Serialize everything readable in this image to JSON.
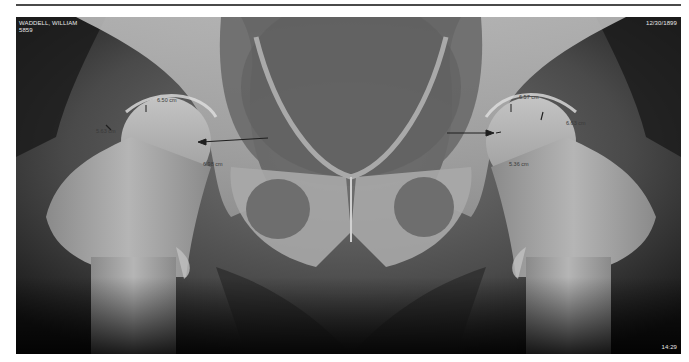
{
  "study": {
    "patient_name": "WADDELL, WILLIAM",
    "patient_id": "5859",
    "date": "12/30/1899",
    "time": "14:29"
  },
  "measurements": {
    "right_hip": [
      {
        "label": "6.50 cm",
        "x": 141,
        "y": 80
      },
      {
        "label": "5.63 cm",
        "x": 80,
        "y": 111
      },
      {
        "label": "6.98 cm",
        "x": 187,
        "y": 144
      }
    ],
    "left_hip": [
      {
        "label": "6.57 cm",
        "x": 503,
        "y": 77
      },
      {
        "label": "6.63 cm",
        "x": 550,
        "y": 103
      },
      {
        "label": "5.36 cm",
        "x": 493,
        "y": 144
      }
    ]
  },
  "colors": {
    "film_background": "#0d0d0d",
    "bone": "#b8b8b8",
    "annotation": "#2a2a2a",
    "overlay_text": "#e8e8e8"
  }
}
